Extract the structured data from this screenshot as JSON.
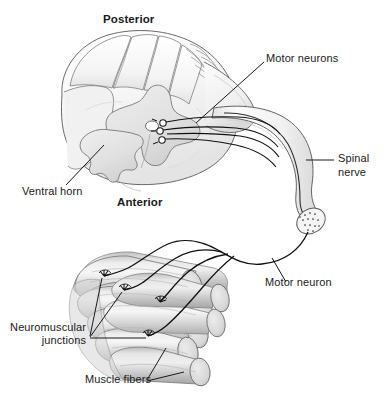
{
  "figure": {
    "type": "anatomical-diagram",
    "background_color": "#ffffff",
    "width": 387,
    "height": 403
  },
  "labels": {
    "posterior": "Posterior",
    "anterior": "Anterior",
    "motor_neurons": "Motor neurons",
    "spinal_nerve_line1": "Spinal",
    "spinal_nerve_line2": "nerve",
    "ventral_horn": "Ventral horn",
    "motor_neuron": "Motor neuron",
    "neuromuscular_line1": "Neuromuscular",
    "neuromuscular_line2": "junctions",
    "muscle_fibers": "Muscle fibers"
  },
  "colors": {
    "outline": "#5a5a5a",
    "dark_line": "#111111",
    "text": "#1a1a1a",
    "white_matter_light": "#fbfbfb",
    "white_matter_mid": "#ededed",
    "grey_matter": "#e2e2e2",
    "grey_matter_shade": "#d2d2d2",
    "nerve_fill": "#f2f2f2",
    "nerve_shade": "#dcdcdc",
    "muscle_light": "#e6e6e6",
    "muscle_mid": "#cfcfcf",
    "muscle_dark": "#b4b4b4",
    "muscle_end": "#dadada"
  },
  "structures": [
    {
      "name": "spinal-cord-cross-section",
      "description": "Transverse section of spinal cord with butterfly-shaped grey matter, central canal, ventral horn and dorsal columns"
    },
    {
      "name": "dorsal-rootlets",
      "description": "Series of fine rootlets along the posterolateral sulcus converging to the dorsal root"
    },
    {
      "name": "motor-neuron-cell-bodies",
      "count": 3,
      "description": "Small circular cell bodies located in the ventral horn"
    },
    {
      "name": "ventral-root-axons",
      "count": 4,
      "description": "Axons leaving the ventral horn and entering the spinal nerve"
    },
    {
      "name": "spinal-nerve",
      "description": "Large curving nerve trunk descending to a cut end showing a stippled fascicle"
    },
    {
      "name": "nerve-cut-end",
      "description": "Elliptical cut face of the spinal nerve with stippled axon profiles"
    },
    {
      "name": "motor-neuron-axon",
      "description": "Single axon leaving the cut nerve end, branching into four terminal branches"
    },
    {
      "name": "muscle-fiber-bundle",
      "count": 9,
      "description": "Bundle of cylindrical skeletal muscle fibers with elliptical cut ends"
    },
    {
      "name": "neuromuscular-junctions",
      "count": 4,
      "description": "Branched motor end plates where axon terminals meet muscle fibers"
    }
  ]
}
